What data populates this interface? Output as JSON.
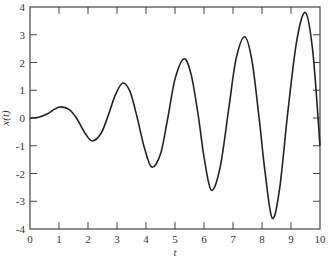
{
  "chart_data": {
    "type": "line",
    "title": "",
    "xlabel": "t",
    "ylabel": "x(t)",
    "xlim": [
      0,
      10
    ],
    "ylim": [
      -4,
      4
    ],
    "xticks": [
      "0",
      "1",
      "2",
      "3",
      "4",
      "5",
      "6",
      "7",
      "8",
      "9",
      "10"
    ],
    "yticks": [
      "4",
      "3",
      "2",
      "1",
      "0",
      "-1",
      "-2",
      "-3",
      "-4"
    ],
    "grid": false,
    "legend": null,
    "series": [
      {
        "name": "x(t)",
        "color": "#222222",
        "x": [
          0,
          0.3,
          0.6,
          0.85,
          1.07,
          1.35,
          1.6,
          1.9,
          2.15,
          2.45,
          2.7,
          2.95,
          3.2,
          3.45,
          3.7,
          3.95,
          4.2,
          4.5,
          4.75,
          5.0,
          5.3,
          5.55,
          5.8,
          6.0,
          6.25,
          6.55,
          6.85,
          7.1,
          7.4,
          7.65,
          7.9,
          8.1,
          8.35,
          8.6,
          8.9,
          9.2,
          9.5,
          9.75,
          10.0
        ],
        "y": [
          0,
          0.03,
          0.15,
          0.32,
          0.4,
          0.3,
          0.0,
          -0.55,
          -0.83,
          -0.55,
          0.1,
          0.85,
          1.26,
          0.95,
          0.0,
          -1.1,
          -1.77,
          -1.3,
          0.0,
          1.4,
          2.13,
          1.6,
          0.1,
          -1.4,
          -2.6,
          -1.8,
          0.3,
          2.1,
          2.93,
          2.1,
          0.0,
          -1.9,
          -3.6,
          -2.6,
          0.3,
          2.8,
          3.8,
          2.4,
          -1.0
        ]
      }
    ]
  },
  "plot": {
    "left": 30,
    "right": 320,
    "top": 7,
    "bottom": 229
  }
}
